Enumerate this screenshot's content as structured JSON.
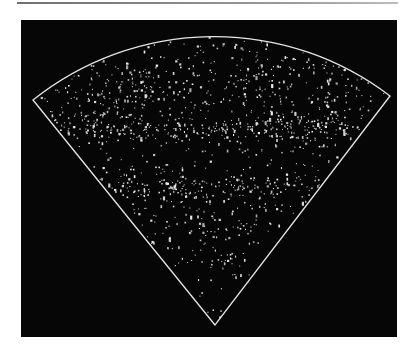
{
  "figure": {
    "type": "redshift-survey-wedge",
    "background_color": "#060606",
    "page_color": "#ffffff",
    "outline_color": "#e6e6e6",
    "point_color": "#f2f2f2",
    "wedge": {
      "apex": [
        194,
        305
      ],
      "radius": 290,
      "left_corner": [
        12,
        80
      ],
      "right_corner": [
        369,
        76
      ]
    },
    "point_generation": {
      "seed": 1986,
      "background_points": 520,
      "clusters": [
        {
          "cx": 194,
          "cy": 110,
          "sx": 120,
          "sy": 6,
          "n": 220,
          "label": "great-wall-band"
        },
        {
          "cx": 194,
          "cy": 168,
          "sx": 90,
          "sy": 7,
          "n": 150,
          "label": "lower-band"
        },
        {
          "cx": 120,
          "cy": 70,
          "sx": 35,
          "sy": 18,
          "n": 80,
          "label": "upper-left-clump"
        },
        {
          "cx": 255,
          "cy": 60,
          "sx": 40,
          "sy": 20,
          "n": 80,
          "label": "upper-right-clump"
        },
        {
          "cx": 300,
          "cy": 95,
          "sx": 25,
          "sy": 18,
          "n": 60,
          "label": "right-clump"
        },
        {
          "cx": 80,
          "cy": 95,
          "sx": 25,
          "sy": 14,
          "n": 60,
          "label": "left-clump"
        },
        {
          "cx": 194,
          "cy": 205,
          "sx": 45,
          "sy": 12,
          "n": 60,
          "label": "mid-low-clump"
        },
        {
          "cx": 195,
          "cy": 240,
          "sx": 22,
          "sy": 10,
          "n": 25,
          "label": "near-apex-clump"
        }
      ]
    }
  }
}
